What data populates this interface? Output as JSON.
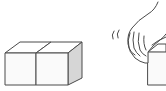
{
  "figure": {
    "colors": {
      "background": "#ffffff",
      "stroke": "#4a4a4a",
      "face_front": "#fafafa",
      "face_top": "#ffffff",
      "face_side": "#d6d6d6"
    },
    "panels": [
      {
        "name": "two-cubes",
        "cube_count": 2
      },
      {
        "name": "hand-grasping-cube",
        "motion_marks": 2
      }
    ]
  }
}
